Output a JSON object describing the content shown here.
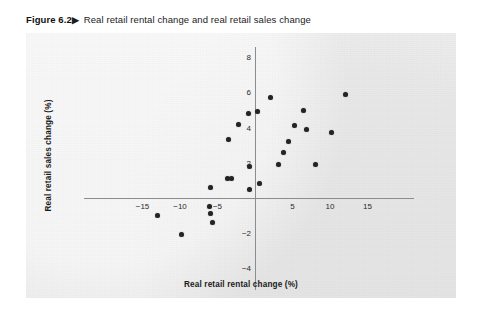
{
  "figure": {
    "number": "Figure 6.2",
    "arrow": "▶",
    "caption": "Real retail rental change and real retail sales change"
  },
  "chart_data": {
    "type": "scatter",
    "title": "Real retail rental change and real retail sales change",
    "xlabel": "Real retail rental change (%)",
    "ylabel": "Real retail sales change (%)",
    "xlim": [
      -19,
      19
    ],
    "ylim": [
      -5,
      9
    ],
    "xticks": [
      -15,
      -10,
      -5,
      5,
      10,
      15
    ],
    "xtick_labels": [
      "−15",
      "−10",
      "−5",
      "5",
      "10",
      "15"
    ],
    "yticks": [
      8,
      6,
      4,
      2,
      -2,
      -4
    ],
    "ytick_labels": [
      "8",
      "6",
      "4",
      "2",
      "−2",
      "−4"
    ],
    "grid": false,
    "legend": null,
    "marker": "filled-circle",
    "marker_color": "#242424",
    "points": [
      {
        "x": -13.0,
        "y": -1.0
      },
      {
        "x": -9.8,
        "y": -2.1
      },
      {
        "x": -6.0,
        "y": 0.6
      },
      {
        "x": -6.1,
        "y": -0.5
      },
      {
        "x": -5.9,
        "y": -0.9
      },
      {
        "x": -5.7,
        "y": -1.4
      },
      {
        "x": -3.7,
        "y": 1.1
      },
      {
        "x": -3.2,
        "y": 1.1
      },
      {
        "x": -3.6,
        "y": 3.3
      },
      {
        "x": -2.2,
        "y": 4.2
      },
      {
        "x": -0.9,
        "y": 4.8
      },
      {
        "x": 0.3,
        "y": 4.9
      },
      {
        "x": 2.1,
        "y": 5.7
      },
      {
        "x": 0.6,
        "y": 0.8
      },
      {
        "x": -0.7,
        "y": 0.5
      },
      {
        "x": -0.8,
        "y": 1.8
      },
      {
        "x": 3.1,
        "y": 1.9
      },
      {
        "x": 3.8,
        "y": 2.6
      },
      {
        "x": 4.4,
        "y": 3.2
      },
      {
        "x": 5.3,
        "y": 4.1
      },
      {
        "x": 6.5,
        "y": 5.0
      },
      {
        "x": 6.9,
        "y": 3.9
      },
      {
        "x": 8.0,
        "y": 1.9
      },
      {
        "x": 10.2,
        "y": 3.7
      },
      {
        "x": 12.0,
        "y": 5.9
      }
    ]
  }
}
